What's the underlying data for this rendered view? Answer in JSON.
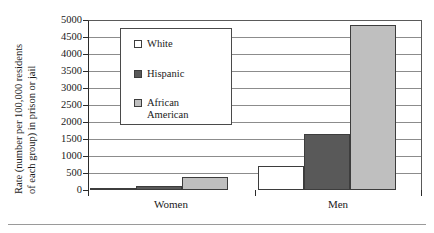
{
  "chart_data": {
    "type": "bar",
    "title": "",
    "subtitle": "",
    "xlabel": "",
    "ylabel": "Rate (number per 100,000 residents of each group) in prison or jail",
    "ylabel_line1": "Rate (number per 100,000 residents",
    "ylabel_line2": "of each group) in prison or jail",
    "categories": [
      "Women",
      "Men"
    ],
    "series": [
      {
        "name": "White",
        "values": [
          68,
          717
        ],
        "color": "#ffffff"
      },
      {
        "name": "Hispanic",
        "values": [
          120,
          1660
        ],
        "color": "#595959"
      },
      {
        "name": "African American",
        "values": [
          380,
          4850
        ],
        "color": "#bfbfbf"
      }
    ],
    "ylim": [
      0,
      5000
    ],
    "yticks": [
      0,
      500,
      1000,
      1500,
      2000,
      2500,
      3000,
      3500,
      4000,
      4500,
      5000
    ],
    "ytick_labels": [
      "0",
      "500",
      "1000",
      "1500",
      "2000",
      "2500",
      "3000",
      "3500",
      "4000",
      "4500",
      "5000"
    ],
    "grid": true,
    "legend_position": "upper-left-inside",
    "legend_entries": [
      {
        "label": "White",
        "swatch": "#ffffff"
      },
      {
        "label": "Hispanic",
        "swatch": "#595959"
      },
      {
        "label": "African American",
        "swatch": "#bfbfbf"
      }
    ]
  },
  "legend": {
    "items": [
      {
        "label": "White"
      },
      {
        "label": "Hispanic"
      },
      {
        "label": "African\nAmerican"
      }
    ]
  },
  "axis": {
    "y_title_line1": "Rate (number per 100,000 residents",
    "y_title_line2": "of each group) in prison or jail",
    "y_labels": [
      "5000",
      "4500",
      "4000",
      "3500",
      "3000",
      "2500",
      "2000",
      "1500",
      "1000",
      "500",
      "0"
    ],
    "x_labels": [
      "Women",
      "Men"
    ]
  },
  "colors": {
    "white_series": "#ffffff",
    "hispanic_series": "#595959",
    "african_american_series": "#bfbfbf",
    "axis": "#2b2b2b",
    "gridline": "#8c8c8c",
    "text": "#1a1a1a"
  }
}
